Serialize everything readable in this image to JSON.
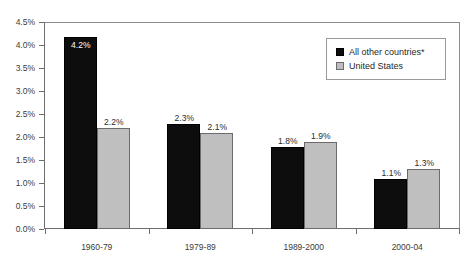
{
  "chart_data": {
    "type": "bar",
    "title": "",
    "subtitle": "",
    "xlabel": "",
    "ylabel": "",
    "categories": [
      "1960-79",
      "1979-89",
      "1989-2000",
      "2000-04"
    ],
    "series": [
      {
        "name": "All other countries*",
        "color": "#0d0d0d",
        "values": [
          4.2,
          2.3,
          1.8,
          1.1
        ],
        "labels": [
          "4.2%",
          "2.3%",
          "1.8%",
          "1.1%"
        ],
        "label_placement": [
          "inside",
          "outside",
          "outside",
          "outside"
        ]
      },
      {
        "name": "United States",
        "color": "#bfbfbf",
        "values": [
          2.2,
          2.1,
          1.9,
          1.3
        ],
        "labels": [
          "2.2%",
          "2.1%",
          "1.9%",
          "1.3%"
        ],
        "label_placement": [
          "outside",
          "outside",
          "outside",
          "outside"
        ]
      }
    ],
    "ylim": [
      0,
      4.5
    ],
    "ytick_values": [
      4.5,
      4.0,
      3.5,
      3.0,
      2.5,
      2.0,
      1.5,
      1.0,
      0.5,
      0.0
    ],
    "ytick_labels": [
      "4.5%",
      "4.0%",
      "3.5%",
      "3.0%",
      "2.5%",
      "2.0%",
      "1.5%",
      "1.0%",
      "0.5%",
      "0.0%"
    ],
    "grid": false,
    "legend_position": "top-right",
    "legend_entries": [
      "All other countries*",
      "United States"
    ]
  },
  "legend": {
    "items": [
      {
        "label": "All other countries*"
      },
      {
        "label": "United States"
      }
    ]
  }
}
